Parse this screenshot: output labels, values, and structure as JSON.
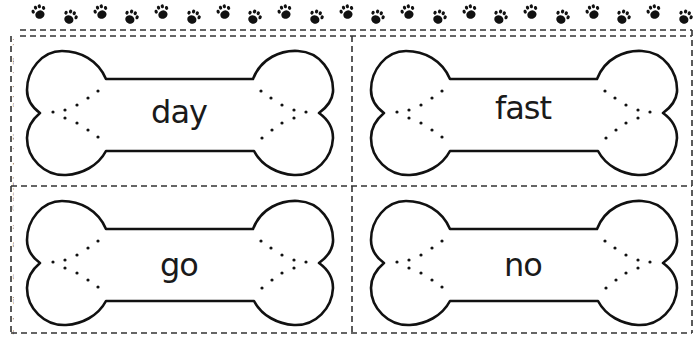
{
  "header": {
    "paw_icon_count": 22
  },
  "credit_line": "Pocket Chart Games: Reading © 2015 by Angie Kurzer, Scholastic Teaching Resources",
  "cards": [
    {
      "word": "day"
    },
    {
      "word": "fast"
    },
    {
      "word": "go"
    },
    {
      "word": "no"
    }
  ],
  "colors": {
    "ink": "#1a1a1a",
    "dash": "#333333",
    "paper": "#ffffff",
    "credit": "#8a8a8a"
  }
}
